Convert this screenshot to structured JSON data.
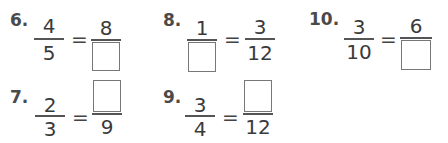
{
  "problems": [
    {
      "number": "6.",
      "left": {
        "num": "4",
        "den": "5"
      },
      "right": {
        "num": "8",
        "den": ""
      },
      "blank": "den"
    },
    {
      "number": "8.",
      "left": {
        "num": "1",
        "den": ""
      },
      "right": {
        "num": "3",
        "den": "12"
      },
      "blank": "left-den"
    },
    {
      "number": "10.",
      "left": {
        "num": "3",
        "den": "10"
      },
      "right": {
        "num": "6",
        "den": ""
      },
      "blank": "den"
    },
    {
      "number": "7.",
      "left": {
        "num": "2",
        "den": "3"
      },
      "right": {
        "num": "",
        "den": "9"
      },
      "blank": "num"
    },
    {
      "number": "9.",
      "left": {
        "num": "3",
        "den": "4"
      },
      "right": {
        "num": "",
        "den": "12"
      },
      "blank": "num"
    }
  ],
  "symbols": {
    "equals": "="
  }
}
